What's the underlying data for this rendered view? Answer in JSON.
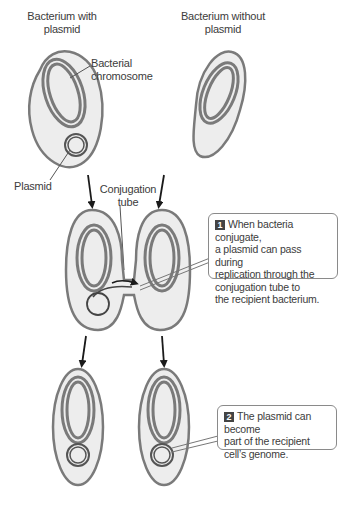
{
  "labels": {
    "with_plasmid": [
      "Bacterium with",
      "plasmid"
    ],
    "without_plasmid": [
      "Bacterium without",
      "plasmid"
    ],
    "chromosome": [
      "Bacterial",
      "chromosome"
    ],
    "plasmid": "Plasmid",
    "tube": [
      "Conjugation",
      "tube"
    ]
  },
  "callouts": [
    {
      "number": "1",
      "lines": [
        "When bacteria conjugate,",
        "a plasmid can pass during",
        "replication through the",
        "conjugation tube to",
        "the recipient bacterium."
      ]
    },
    {
      "number": "2",
      "lines": [
        "The plasmid can become",
        "part of the recipient",
        "cell’s genome."
      ]
    }
  ],
  "colors": {
    "cell_fill": "#ededed",
    "outline": "#7a7a7a",
    "arrow": "#1a1a1a"
  }
}
